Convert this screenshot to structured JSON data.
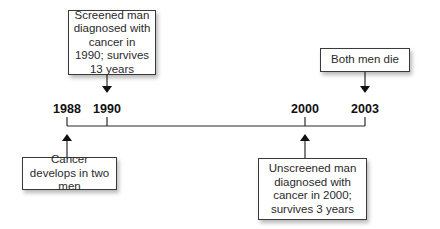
{
  "diagram": {
    "type": "timeline",
    "years": [
      {
        "label": "1988",
        "x": 67
      },
      {
        "label": "1990",
        "x": 107
      },
      {
        "label": "2000",
        "x": 305
      },
      {
        "label": "2003",
        "x": 365
      }
    ],
    "events": {
      "screened": "Screened man diagnosed with cancer in 1990; survives 13 years",
      "both_die": "Both men die",
      "develops": "Cancer develops in two men",
      "unscreened": "Unscreened man diagnosed with cancer in 2000; survives 3 years"
    },
    "colors": {
      "line": "#2a2a2a",
      "border": "#3a3a3a",
      "text": "#1a1a1a"
    }
  }
}
